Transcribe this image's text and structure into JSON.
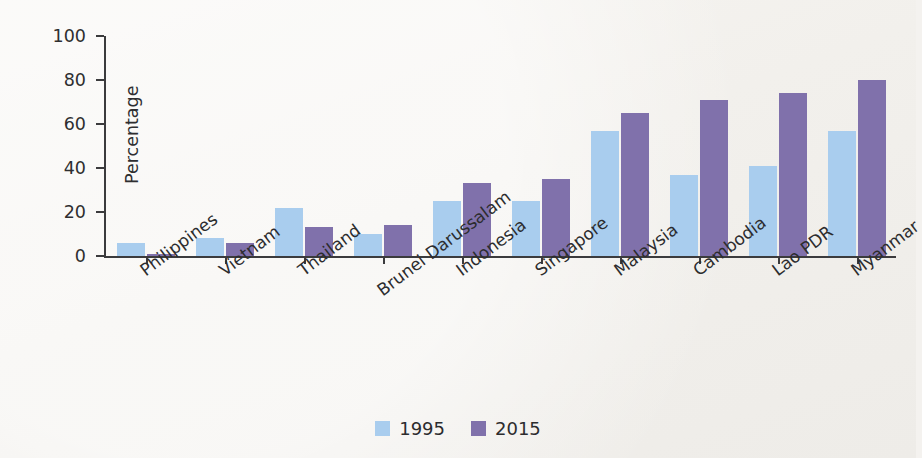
{
  "chart_data": {
    "type": "bar",
    "title": "",
    "xlabel": "",
    "ylabel": "Percentage",
    "ylim": [
      0,
      100
    ],
    "yticks": [
      0,
      20,
      40,
      60,
      80,
      100
    ],
    "grid": false,
    "legend_position": "bottom-center",
    "categories": [
      "Philippines",
      "Vietnam",
      "Thailand",
      "Brunei Darussalam",
      "Indonesia",
      "Singapore",
      "Malaysia",
      "Cambodia",
      "Lao PDR",
      "Myanmar"
    ],
    "series": [
      {
        "name": "1995",
        "color": "#a9cdee",
        "values": [
          6,
          8,
          22,
          10,
          25,
          25,
          57,
          37,
          41,
          57
        ]
      },
      {
        "name": "2015",
        "color": "#8071ab",
        "values": [
          1,
          6,
          13,
          14,
          33,
          35,
          65,
          71,
          74,
          80
        ]
      }
    ]
  },
  "axis": {
    "y_title": "Percentage",
    "y_tick_labels": [
      "0",
      "20",
      "40",
      "60",
      "80",
      "100"
    ]
  },
  "legend": {
    "items": [
      {
        "label": "1995",
        "color": "#a9cdee"
      },
      {
        "label": "2015",
        "color": "#8071ab"
      }
    ]
  },
  "colors": {
    "series_1995": "#a9cdee",
    "series_2015": "#8071ab",
    "axis": "#3b3b3d",
    "text": "#2c2c2e",
    "background": "#f2f0ec"
  }
}
